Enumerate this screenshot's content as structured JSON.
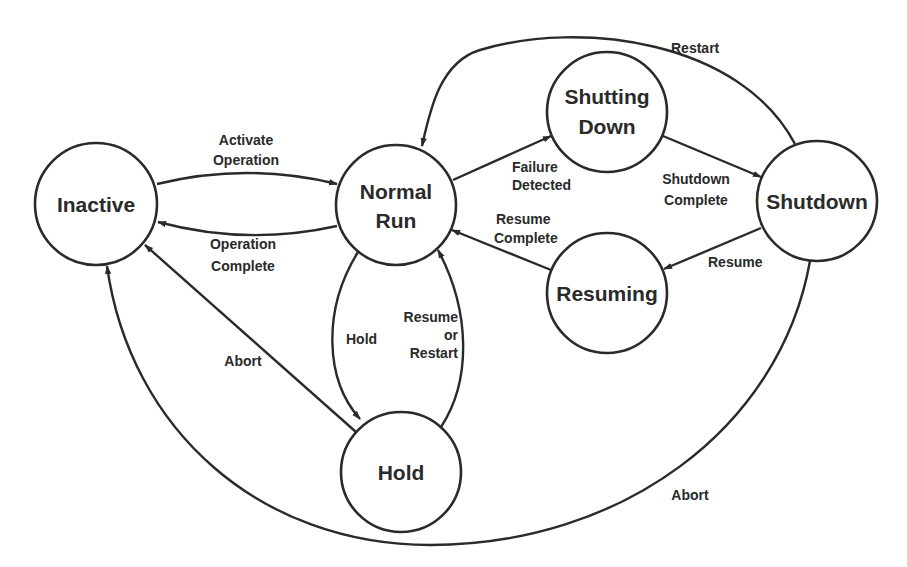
{
  "diagram": {
    "type": "state-transition",
    "states": {
      "inactive": {
        "label": "Inactive"
      },
      "normal_run": {
        "line1": "Normal",
        "line2": "Run"
      },
      "shutting_down": {
        "line1": "Shutting",
        "line2": "Down"
      },
      "shutdown": {
        "label": "Shutdown"
      },
      "resuming": {
        "label": "Resuming"
      },
      "hold": {
        "label": "Hold"
      }
    },
    "transitions": {
      "activate_operation": {
        "from": "Inactive",
        "to": "Normal Run",
        "line1": "Activate",
        "line2": "Operation"
      },
      "operation_complete": {
        "from": "Normal Run",
        "to": "Inactive",
        "line1": "Operation",
        "line2": "Complete"
      },
      "failure_detected": {
        "from": "Normal Run",
        "to": "Shutting Down",
        "line1": "Failure",
        "line2": "Detected"
      },
      "shutdown_complete": {
        "from": "Shutting Down",
        "to": "Shutdown",
        "line1": "Shutdown",
        "line2": "Complete"
      },
      "restart": {
        "from": "Shutdown",
        "to": "Normal Run",
        "label": "Restart"
      },
      "resume": {
        "from": "Shutdown",
        "to": "Resuming",
        "label": "Resume"
      },
      "resume_complete": {
        "from": "Resuming",
        "to": "Normal Run",
        "line1": "Resume",
        "line2": "Complete"
      },
      "hold": {
        "from": "Normal Run",
        "to": "Hold",
        "label": "Hold"
      },
      "resume_or_restart": {
        "from": "Hold",
        "to": "Normal Run",
        "line1": "Resume",
        "line2": "or",
        "line3": "Restart"
      },
      "abort_from_hold": {
        "from": "Hold",
        "to": "Inactive",
        "label": "Abort"
      },
      "abort_from_shutdown": {
        "from": "Shutdown",
        "to": "Inactive",
        "label": "Abort"
      }
    },
    "colors": {
      "line": "#2a2a2a",
      "background": "#ffffff"
    }
  }
}
